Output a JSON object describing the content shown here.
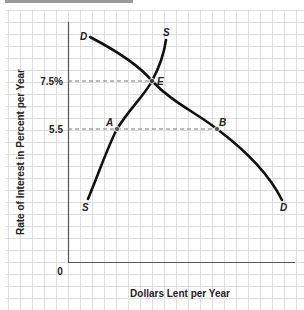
{
  "chart_data": {
    "type": "line",
    "title": "",
    "xlabel": "Dollars Lent per Year",
    "ylabel": "Rate of Interest in Percent per Year",
    "origin_label": "0",
    "y_ticks": [
      {
        "label": "7.5%",
        "value": 7.5
      },
      {
        "label": "5.5",
        "value": 5.5
      }
    ],
    "grid": true,
    "series": [
      {
        "name": "S",
        "label_top": "S",
        "label_bottom": "S",
        "description": "Supply of loanable funds (upward sloping)",
        "points": [
          [
            88,
            199
          ],
          [
            117,
            129
          ],
          [
            152,
            81
          ],
          [
            166,
            40
          ]
        ]
      },
      {
        "name": "D",
        "label_top": "D",
        "label_bottom": "D",
        "description": "Demand for loanable funds (downward sloping)",
        "points": [
          [
            90,
            37
          ],
          [
            152,
            81
          ],
          [
            217,
            129
          ],
          [
            282,
            200
          ]
        ]
      }
    ],
    "annotations": [
      {
        "label": "E",
        "description": "Equilibrium",
        "rate": 7.5
      },
      {
        "label": "A",
        "description": "Point on supply curve",
        "rate": 5.5
      },
      {
        "label": "B",
        "description": "Point on demand curve",
        "rate": 5.5
      }
    ]
  },
  "labels": {
    "x_axis": "Dollars Lent per Year",
    "y_axis": "Rate of Interest in Percent per Year",
    "origin": "0",
    "tick_high": "7.5%",
    "tick_low": "5.5",
    "point_e": "E",
    "point_a": "A",
    "point_b": "B",
    "s_top": "S",
    "s_bottom": "S",
    "d_top": "D",
    "d_bottom": "D"
  },
  "colors": {
    "grid": "#dedede",
    "curve": "#111111",
    "axis": "#555555",
    "dash": "#777777"
  }
}
